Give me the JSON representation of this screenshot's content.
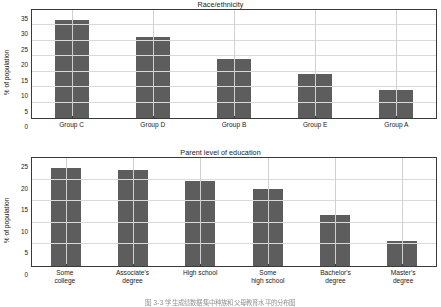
{
  "figure": {
    "caption": "图 3-3   学生成绩数据集中种族和父母教育水平的分布图"
  },
  "charts": [
    {
      "id": "race",
      "title": "Race/ethnicity",
      "ylabel": "% of population"
    },
    {
      "id": "parent",
      "title": "Parent level of education",
      "ylabel": "% of population"
    }
  ],
  "chart_data": [
    {
      "type": "bar",
      "title": "Race/ethnicity",
      "xlabel": "",
      "ylabel": "% of population",
      "categories": [
        "Group C",
        "Group D",
        "Group B",
        "Group E",
        "Group A"
      ],
      "values": [
        31.9,
        26.2,
        19.1,
        14.2,
        9.2
      ],
      "ylim": [
        0,
        35
      ],
      "yticks": [
        0,
        5,
        10,
        15,
        20,
        25,
        30,
        35
      ],
      "grid": true,
      "legend": false,
      "bar_color": "#5d5d5d"
    },
    {
      "type": "bar",
      "title": "Parent level of education",
      "xlabel": "",
      "ylabel": "% of population",
      "categories": [
        "Some\ncollege",
        "Associate's\ndegree",
        "High school",
        "Some\nhigh school",
        "Bachelor's\ndegree",
        "Master's\ndegree"
      ],
      "values": [
        22.6,
        22.2,
        19.6,
        17.9,
        11.8,
        5.9
      ],
      "ylim": [
        0,
        25
      ],
      "yticks": [
        0,
        5,
        10,
        15,
        20,
        25
      ],
      "grid": true,
      "legend": false,
      "bar_color": "#5d5d5d"
    }
  ]
}
